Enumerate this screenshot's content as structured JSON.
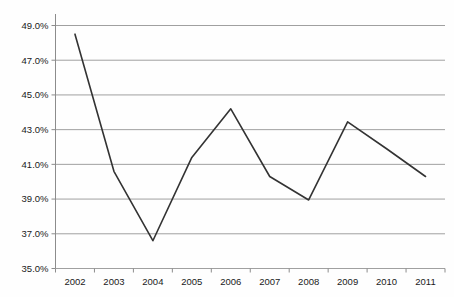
{
  "chart_data": {
    "type": "line",
    "title": "",
    "subtitle": "",
    "xlabel": "",
    "ylabel": "",
    "categories": [
      "2002",
      "2003",
      "2004",
      "2005",
      "2006",
      "2007",
      "2008",
      "2009",
      "2010",
      "2011"
    ],
    "values": [
      48.5,
      40.6,
      36.6,
      41.4,
      44.2,
      40.3,
      38.95,
      43.45,
      41.9,
      40.3
    ],
    "series": [
      {
        "name": "",
        "values": [
          48.5,
          40.6,
          36.6,
          41.4,
          44.2,
          40.3,
          38.95,
          43.45,
          41.9,
          40.3
        ]
      }
    ],
    "ylim": [
      35.0,
      49.0
    ],
    "ytick_values": [
      35.0,
      37.0,
      39.0,
      41.0,
      43.0,
      45.0,
      47.0,
      49.0
    ],
    "ytick_labels": [
      "35.0%",
      "37.0%",
      "39.0%",
      "41.0%",
      "43.0%",
      "45.0%",
      "47.0%",
      "49.0%"
    ],
    "xtick_labels": [
      "2002",
      "2003",
      "2004",
      "2005",
      "2006",
      "2007",
      "2008",
      "2009",
      "2010",
      "2011"
    ],
    "grid": true,
    "grid_axis": "y",
    "legend": false,
    "legend_position": "none",
    "markers": false,
    "value_format": "percent",
    "colors": {
      "line": "#333333",
      "grid": "#a0a0a0",
      "axis": "#8c8c8c",
      "background": "#fefefe",
      "text": "#1a1a1a"
    }
  }
}
